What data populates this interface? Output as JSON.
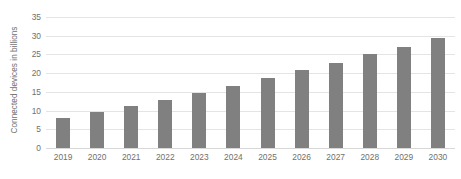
{
  "chart_data": {
    "type": "bar",
    "title": "",
    "subtitle": "",
    "xlabel": "",
    "ylabel": "Connected devices in billions",
    "categories": [
      "2019",
      "2020",
      "2021",
      "2022",
      "2023",
      "2024",
      "2025",
      "2026",
      "2027",
      "2028",
      "2029",
      "2030"
    ],
    "values": [
      8.1,
      9.5,
      11.1,
      12.9,
      14.8,
      16.7,
      18.8,
      20.8,
      22.8,
      25.0,
      27.1,
      29.3
    ],
    "ylim": [
      0,
      35
    ],
    "yticks": [
      0,
      5,
      10,
      15,
      20,
      25,
      30,
      35
    ],
    "ytick_labels": [
      "0",
      "5",
      "10",
      "15",
      "20",
      "25",
      "30",
      "35"
    ],
    "grid": true,
    "legend": false,
    "legend_position": "none",
    "bar_color": "#808080",
    "gridline_color": "#e4e4e4",
    "axis_text_color": "#6f6f6f",
    "background_color": "#ffffff"
  }
}
